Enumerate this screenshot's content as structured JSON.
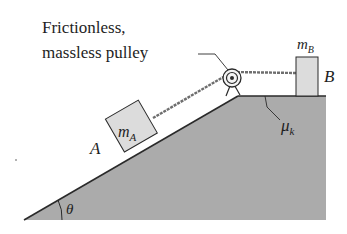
{
  "diagram": {
    "callout_line1": "Frictionless,",
    "callout_line2": "massless pulley",
    "block_a": {
      "label": "A",
      "mass": "m",
      "mass_sub": "A"
    },
    "block_b": {
      "label": "B",
      "mass": "m",
      "mass_sub": "B"
    },
    "friction": {
      "symbol": "μ",
      "sub": "k"
    },
    "angle": "θ",
    "colors": {
      "ground": "#ababab",
      "block": "#dcdcdc",
      "line": "#2a2a2a",
      "rope": "#6e6e6e"
    }
  }
}
